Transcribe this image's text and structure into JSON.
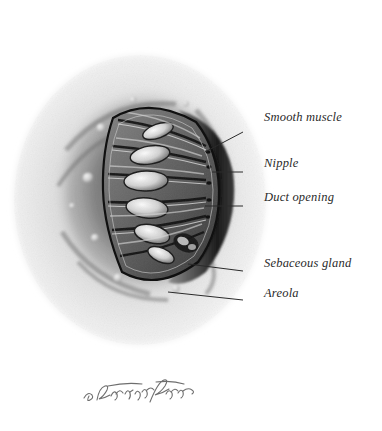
{
  "illustration": {
    "subject": "Nipple and areola anatomy with wedge cutaway",
    "medium": "grayscale airbrush and pencil rendering",
    "background_color": "#ffffff",
    "ink_color": "#2a2a2a",
    "signature": "S. Shapiro Brennan"
  },
  "labels": [
    {
      "id": "smooth-muscle",
      "text": "Smooth muscle",
      "x": 264,
      "y": 118,
      "leader": {
        "x1": 243,
        "y1": 132,
        "x2": 205,
        "y2": 152
      }
    },
    {
      "id": "nipple",
      "text": "Nipple",
      "x": 264,
      "y": 164,
      "leader": {
        "x1": 243,
        "y1": 172,
        "x2": 212,
        "y2": 172
      }
    },
    {
      "id": "duct-opening",
      "text": "Duct opening",
      "x": 264,
      "y": 198,
      "leader": {
        "x1": 243,
        "y1": 206,
        "x2": 205,
        "y2": 206
      }
    },
    {
      "id": "sebaceous-gland",
      "text": "Sebaceous gland",
      "x": 264,
      "y": 264,
      "leader": {
        "x1": 243,
        "y1": 271,
        "x2": 188,
        "y2": 264
      }
    },
    {
      "id": "areola",
      "text": "Areola",
      "x": 264,
      "y": 294,
      "leader": {
        "x1": 243,
        "y1": 300,
        "x2": 168,
        "y2": 292
      }
    }
  ],
  "anatomy": {
    "sinuses": [
      {
        "cx": 158,
        "cy": 131,
        "rx": 16,
        "ry": 7,
        "rot": -20
      },
      {
        "cx": 150,
        "cy": 155,
        "rx": 20,
        "ry": 9,
        "rot": -10
      },
      {
        "cx": 146,
        "cy": 181,
        "rx": 22,
        "ry": 10,
        "rot": -2
      },
      {
        "cx": 147,
        "cy": 208,
        "rx": 21,
        "ry": 10,
        "rot": 6
      },
      {
        "cx": 152,
        "cy": 234,
        "rx": 18,
        "ry": 9,
        "rot": 14
      },
      {
        "cx": 161,
        "cy": 255,
        "rx": 14,
        "ry": 7,
        "rot": 24
      }
    ],
    "tubercles": [
      {
        "cx": 101,
        "cy": 128,
        "r": 4.5
      },
      {
        "cx": 88,
        "cy": 178,
        "r": 5.5
      },
      {
        "cx": 95,
        "cy": 238,
        "r": 4.0
      },
      {
        "cx": 118,
        "cy": 278,
        "r": 4.5
      },
      {
        "cx": 176,
        "cy": 289,
        "r": 4.0
      },
      {
        "cx": 207,
        "cy": 262,
        "r": 3.5
      },
      {
        "cx": 133,
        "cy": 100,
        "r": 3.5
      },
      {
        "cx": 186,
        "cy": 104,
        "r": 3.0
      }
    ]
  }
}
